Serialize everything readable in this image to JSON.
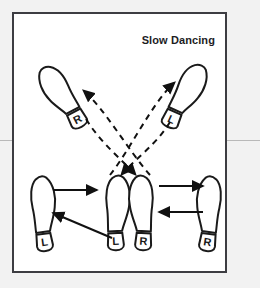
{
  "page": {
    "background_color": "#f2f2f2",
    "panel_background": "#ffffff",
    "panel_border_color": "#3d3d42",
    "ink_color": "#1a1a1a",
    "margin_rule_color": "#b9b9b9"
  },
  "title": "Slow Dancing",
  "diagram": {
    "type": "dance-step-footprint-chart",
    "footprints": [
      {
        "id": "upper-left",
        "label": "R",
        "side": "right",
        "row": "upper",
        "position": "upper-left",
        "toe_x": 48,
        "toe_y": 66,
        "heel_x": 78,
        "heel_y": 119,
        "rotation_deg": -28
      },
      {
        "id": "upper-right",
        "label": "L",
        "side": "left",
        "row": "upper",
        "position": "upper-right",
        "toe_x": 196,
        "toe_y": 63,
        "heel_x": 172,
        "heel_y": 118,
        "rotation_deg": 24
      },
      {
        "id": "lower-far-left",
        "label": "L",
        "side": "left",
        "row": "lower",
        "position": "lower-far-left",
        "toe_x": 35,
        "toe_y": 181,
        "heel_x": 44,
        "heel_y": 245,
        "rotation_deg": -8
      },
      {
        "id": "lower-center-left",
        "label": "L",
        "side": "left",
        "row": "lower",
        "position": "lower-center-left",
        "toe_x": 112,
        "toe_y": 178,
        "heel_x": 117,
        "heel_y": 243,
        "rotation_deg": -3
      },
      {
        "id": "lower-center-right",
        "label": "R",
        "side": "right",
        "row": "lower",
        "position": "lower-center-right",
        "toe_x": 146,
        "toe_y": 178,
        "heel_x": 142,
        "heel_y": 243,
        "rotation_deg": 3
      },
      {
        "id": "lower-far-right",
        "label": "R",
        "side": "right",
        "row": "lower",
        "position": "lower-far-right",
        "toe_x": 215,
        "toe_y": 181,
        "heel_x": 209,
        "heel_y": 245,
        "rotation_deg": 8
      }
    ],
    "arrows": [
      {
        "id": "arrow-left-outward",
        "style": "solid",
        "from": "lower-far-left",
        "to": "lower-center-left",
        "direction": "right"
      },
      {
        "id": "arrow-left-return",
        "style": "solid",
        "from": "lower-center-left",
        "to": "lower-far-left",
        "direction": "left-up"
      },
      {
        "id": "arrow-right-outward",
        "style": "solid",
        "from": "lower-center-right",
        "to": "lower-far-right",
        "direction": "right"
      },
      {
        "id": "arrow-right-return",
        "style": "solid",
        "from": "lower-far-right",
        "to": "lower-center-right",
        "direction": "left"
      },
      {
        "id": "arrow-cross-up-left",
        "style": "dashed",
        "from": "lower-center-right",
        "to": "upper-left",
        "direction": "up-left"
      },
      {
        "id": "arrow-cross-up-right",
        "style": "dashed",
        "from": "lower-center-left",
        "to": "upper-right",
        "direction": "up-right"
      },
      {
        "id": "arrow-cross-down-left",
        "style": "dashed",
        "from": "upper-right",
        "to": "lower-center-left",
        "direction": "down-left"
      },
      {
        "id": "arrow-cross-down-right",
        "style": "dashed",
        "from": "upper-left",
        "to": "lower-center-right",
        "direction": "down-right"
      }
    ]
  }
}
